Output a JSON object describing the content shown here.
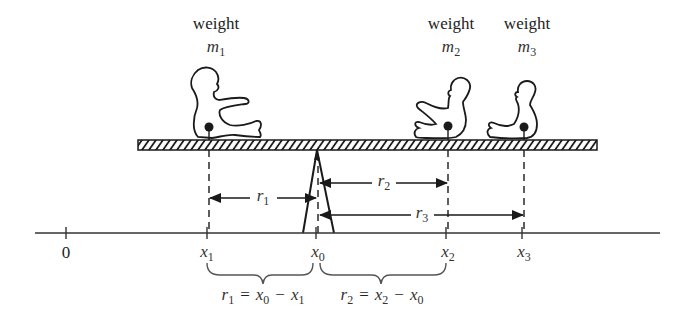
{
  "figure": {
    "weights": [
      {
        "label": "weight",
        "symbol": "m",
        "subscript": "1"
      },
      {
        "label": "weight",
        "symbol": "m",
        "subscript": "2"
      },
      {
        "label": "weight",
        "symbol": "m",
        "subscript": "3"
      }
    ],
    "axis": {
      "origin_label": "0",
      "ticks": [
        {
          "symbol": "x",
          "subscript": "1"
        },
        {
          "symbol": "x",
          "subscript": "0"
        },
        {
          "symbol": "x",
          "subscript": "2"
        },
        {
          "symbol": "x",
          "subscript": "3"
        }
      ]
    },
    "distances": [
      {
        "symbol": "r",
        "subscript": "1"
      },
      {
        "symbol": "r",
        "subscript": "2"
      },
      {
        "symbol": "r",
        "subscript": "3"
      }
    ],
    "equations": [
      {
        "lhs": "r",
        "lhs_sub": "1",
        "eq": "=",
        "a": "x",
        "a_sub": "0",
        "op": "−",
        "b": "x",
        "b_sub": "1"
      },
      {
        "lhs": "r",
        "lhs_sub": "2",
        "eq": "=",
        "a": "x",
        "a_sub": "2",
        "op": "−",
        "b": "x",
        "b_sub": "0"
      }
    ]
  },
  "colors": {
    "ink": "#1a1a1a",
    "background": "#ffffff"
  }
}
